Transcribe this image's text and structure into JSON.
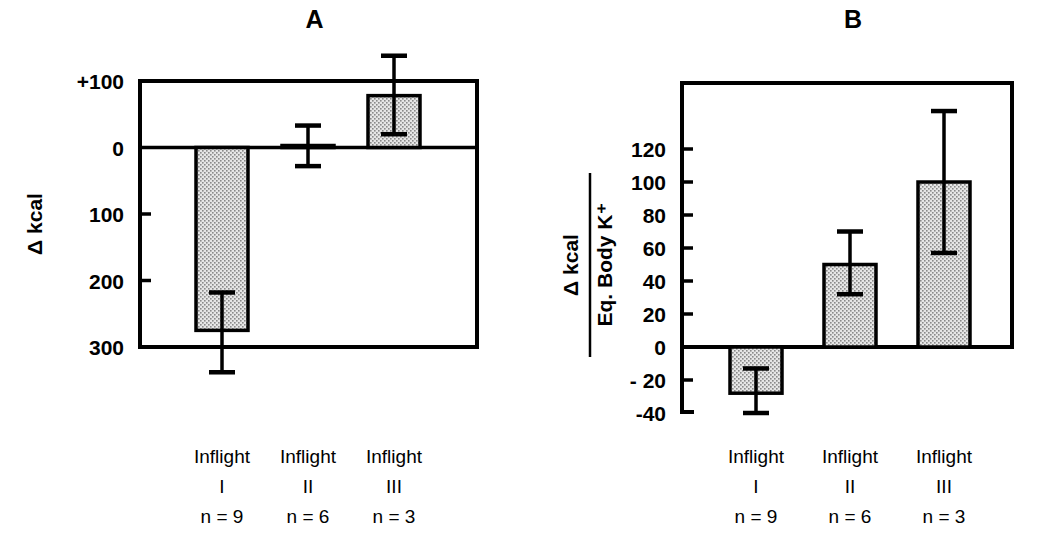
{
  "figure": {
    "background_color": "#ffffff",
    "ink_color": "#000000",
    "bar_fill_color": "#dcdcdc"
  },
  "chart_data": [
    {
      "type": "bar",
      "title": "A",
      "panel_id": "A",
      "xlabel": "",
      "ylabel": "Δ kcal",
      "categories": [
        "Inflight I",
        "Inflight II",
        "Inflight III"
      ],
      "category_lines": [
        [
          "Inflight",
          "I",
          "n = 9"
        ],
        [
          "Inflight",
          "II",
          "n = 6"
        ],
        [
          "Inflight",
          "III",
          "n = 3"
        ]
      ],
      "values": [
        -275,
        3,
        78
      ],
      "errors_upper": [
        -218,
        33,
        138
      ],
      "errors_lower": [
        -338,
        -28,
        20
      ],
      "ytick_labels": [
        "+100",
        "0",
        "100",
        "200",
        "300"
      ],
      "ytick_values": [
        100,
        0,
        -100,
        -200,
        -300
      ],
      "ylim": [
        -300,
        100
      ],
      "axis_inverted_below_zero": true,
      "grid": false,
      "legend": "none",
      "note": "Values below zero are labelled as positive magnitudes (100, 200, 300) on the axis"
    },
    {
      "type": "bar",
      "title": "B",
      "panel_id": "B",
      "xlabel": "",
      "ylabel_numerator": "Δ kcal",
      "ylabel_denominator": "Eq. Body K⁺",
      "categories": [
        "Inflight I",
        "Inflight II",
        "Inflight III"
      ],
      "category_lines": [
        [
          "Inflight",
          "I",
          "n = 9"
        ],
        [
          "Inflight",
          "II",
          "n = 6"
        ],
        [
          "Inflight",
          "III",
          "n = 3"
        ]
      ],
      "values": [
        -28,
        50,
        100
      ],
      "errors_upper": [
        -13,
        70,
        143
      ],
      "errors_lower": [
        -40,
        32,
        57
      ],
      "ytick_labels": [
        "120",
        "100",
        "80",
        "60",
        "40",
        "20",
        "0",
        "- 20",
        "-40"
      ],
      "ytick_values": [
        120,
        100,
        80,
        60,
        40,
        20,
        0,
        -20,
        -40
      ],
      "ylim": [
        -40,
        140
      ],
      "grid": false,
      "legend": "none"
    }
  ]
}
